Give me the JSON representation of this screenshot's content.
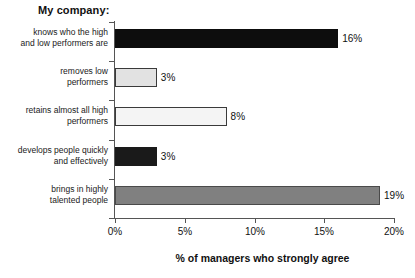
{
  "chart_data": {
    "type": "bar",
    "orientation": "horizontal",
    "title": "My company:",
    "xlabel": "% of managers who strongly agree",
    "ylabel": "",
    "xlim": [
      0,
      20
    ],
    "xticks": [
      "0%",
      "5%",
      "10%",
      "15%",
      "20%"
    ],
    "xtick_values": [
      0,
      5,
      10,
      15,
      20
    ],
    "grid": false,
    "legend": "none",
    "categories": [
      "knows who the high\nand low performers are",
      "removes low\nperformers",
      "retains almost all high\nperformers",
      "develops people quickly\nand effectively",
      "brings in highly\ntalented people"
    ],
    "values": [
      16,
      3,
      8,
      3,
      19
    ],
    "value_labels": [
      "16%",
      "3%",
      "8%",
      "3%",
      "19%"
    ],
    "bars": [
      {
        "label_line1": "knows who the high",
        "label_line2": "and low performers are",
        "value": 16,
        "value_label": "16%",
        "fill": "#0d0d0d",
        "border": "#0d0d0d"
      },
      {
        "label_line1": "removes low",
        "label_line2": "performers",
        "value": 3,
        "value_label": "3%",
        "fill": "#e2e2e2",
        "border": "#3a3a3a"
      },
      {
        "label_line1": "retains almost all high",
        "label_line2": "performers",
        "value": 8,
        "value_label": "8%",
        "fill": "#f4f4f4",
        "border": "#3a3a3a"
      },
      {
        "label_line1": "develops people quickly",
        "label_line2": "and effectively",
        "value": 3,
        "value_label": "3%",
        "fill": "#1a1a1a",
        "border": "#1a1a1a"
      },
      {
        "label_line1": "brings in highly",
        "label_line2": "talented people",
        "value": 19,
        "value_label": "19%",
        "fill": "#808080",
        "border": "#4a4a4a"
      }
    ],
    "colors": {
      "axis": "#555555",
      "text": "#111111",
      "background": "#ffffff"
    }
  }
}
